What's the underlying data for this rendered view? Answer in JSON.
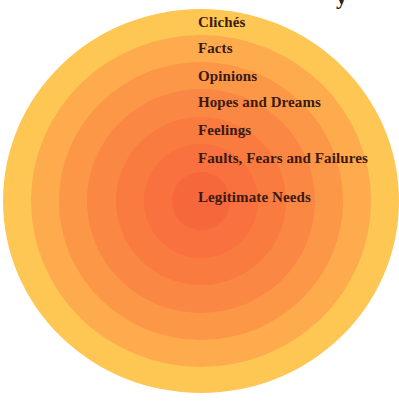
{
  "title_fragment": "y",
  "diagram": {
    "center": {
      "x": 201,
      "y": 201
    },
    "rings": [
      {
        "name": "cliches-ring",
        "label": "Clichés",
        "rx": 198,
        "ry": 192,
        "color": "#FEC653"
      },
      {
        "name": "facts-ring",
        "label": "Facts",
        "rx": 170,
        "ry": 166,
        "color": "#FDAB4C"
      },
      {
        "name": "opinions-ring",
        "label": "Opinions",
        "rx": 142,
        "ry": 139,
        "color": "#FB9746"
      },
      {
        "name": "hopes-and-dreams-ring",
        "label": "Hopes and Dreams",
        "rx": 114,
        "ry": 112,
        "color": "#FA8743"
      },
      {
        "name": "feelings-ring",
        "label": "Feelings",
        "rx": 85,
        "ry": 84,
        "color": "#F97B40"
      },
      {
        "name": "faults-fears-failures-ring",
        "label": "Faults, Fears and Failures",
        "rx": 57,
        "ry": 57,
        "color": "#F8713E"
      },
      {
        "name": "legitimate-needs-ring",
        "label": "Legitimate Needs",
        "rx": 29,
        "ry": 29,
        "color": "#F7673C"
      }
    ]
  },
  "labels": [
    {
      "text": "Clichés",
      "top": 15
    },
    {
      "text": "Facts",
      "top": 41
    },
    {
      "text": "Opinions",
      "top": 69
    },
    {
      "text": "Hopes and Dreams",
      "top": 95
    },
    {
      "text": "Feelings",
      "top": 123
    },
    {
      "text": "Faults, Fears and Failures",
      "top": 151
    },
    {
      "text": "Legitimate Needs",
      "top": 190
    }
  ],
  "colors": {
    "text": "#3a1a12",
    "background": "#ffffff"
  }
}
